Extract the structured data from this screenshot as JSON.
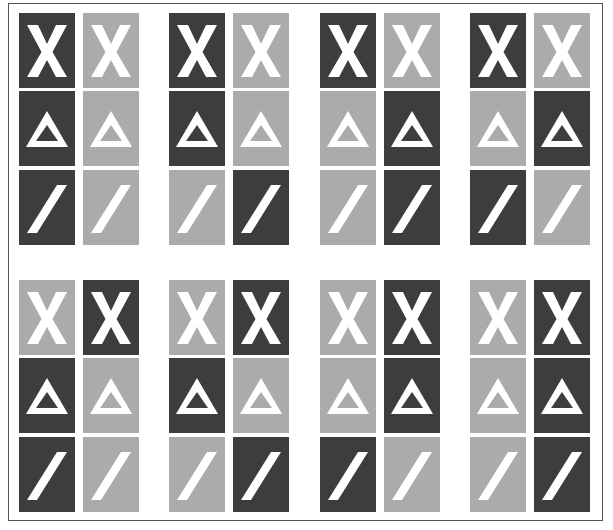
{
  "figure": {
    "colors": {
      "dark": "#3d3d3d",
      "light": "#ababab",
      "symbol": "#ffffff",
      "border": "#555555"
    },
    "rows": [
      "x",
      "triangle",
      "slash"
    ],
    "groups": [
      {
        "section": "top",
        "index": 1,
        "tiles": {
          "x": [
            "dark",
            "light"
          ],
          "triangle": [
            "dark",
            "light"
          ],
          "slash": [
            "dark",
            "light"
          ]
        }
      },
      {
        "section": "top",
        "index": 2,
        "tiles": {
          "x": [
            "dark",
            "light"
          ],
          "triangle": [
            "dark",
            "light"
          ],
          "slash": [
            "light",
            "dark"
          ]
        }
      },
      {
        "section": "top",
        "index": 3,
        "tiles": {
          "x": [
            "dark",
            "light"
          ],
          "triangle": [
            "light",
            "dark"
          ],
          "slash": [
            "light",
            "dark"
          ]
        }
      },
      {
        "section": "top",
        "index": 4,
        "tiles": {
          "x": [
            "dark",
            "light"
          ],
          "triangle": [
            "light",
            "dark"
          ],
          "slash": [
            "dark",
            "light"
          ]
        }
      },
      {
        "section": "bottom",
        "index": 1,
        "tiles": {
          "x": [
            "light",
            "dark"
          ],
          "triangle": [
            "dark",
            "light"
          ],
          "slash": [
            "dark",
            "light"
          ]
        }
      },
      {
        "section": "bottom",
        "index": 2,
        "tiles": {
          "x": [
            "light",
            "dark"
          ],
          "triangle": [
            "dark",
            "light"
          ],
          "slash": [
            "light",
            "dark"
          ]
        }
      },
      {
        "section": "bottom",
        "index": 3,
        "tiles": {
          "x": [
            "light",
            "dark"
          ],
          "triangle": [
            "light",
            "dark"
          ],
          "slash": [
            "dark",
            "light"
          ]
        }
      },
      {
        "section": "bottom",
        "index": 4,
        "tiles": {
          "x": [
            "light",
            "dark"
          ],
          "triangle": [
            "light",
            "dark"
          ],
          "slash": [
            "light",
            "dark"
          ]
        }
      }
    ]
  }
}
